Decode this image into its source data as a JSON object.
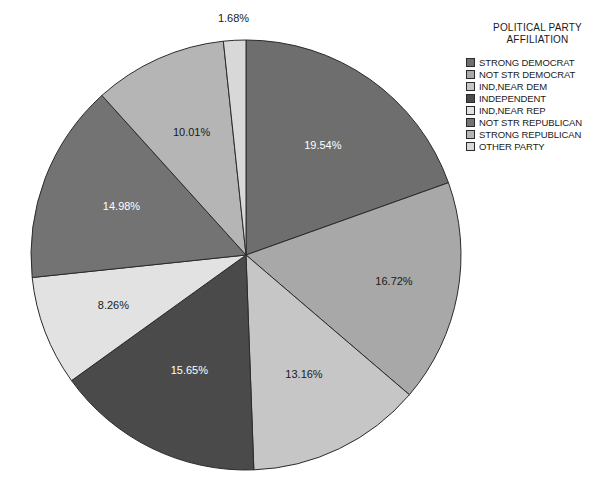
{
  "legend": {
    "title_line1": "POLITICAL PARTY",
    "title_line2": "AFFILIATION",
    "items": [
      {
        "label": "STRONG DEMOCRAT",
        "color": "#6e6e6e"
      },
      {
        "label": "NOT STR DEMOCRAT",
        "color": "#a8a8a8"
      },
      {
        "label": "IND,NEAR DEM",
        "color": "#c6c6c6"
      },
      {
        "label": "INDEPENDENT",
        "color": "#4a4a4a"
      },
      {
        "label": "IND,NEAR REP",
        "color": "#e2e2e2"
      },
      {
        "label": "NOT STR REPUBLICAN",
        "color": "#737373"
      },
      {
        "label": "STRONG REPUBLICAN",
        "color": "#b5b5b5"
      },
      {
        "label": "OTHER PARTY",
        "color": "#d8d8d8"
      }
    ]
  },
  "chart_data": {
    "type": "pie",
    "title": "POLITICAL PARTY AFFILIATION",
    "categories": [
      "STRONG DEMOCRAT",
      "NOT STR DEMOCRAT",
      "IND,NEAR DEM",
      "INDEPENDENT",
      "IND,NEAR REP",
      "NOT STR REPUBLICAN",
      "STRONG REPUBLICAN",
      "OTHER PARTY"
    ],
    "values": [
      19.54,
      16.72,
      13.16,
      15.65,
      8.26,
      14.98,
      10.01,
      1.68
    ],
    "labels": [
      "19.54%",
      "16.72%",
      "13.16%",
      "15.65%",
      "8.26%",
      "14.98%",
      "10.01%",
      "1.68%"
    ],
    "colors": [
      "#6e6e6e",
      "#a8a8a8",
      "#c6c6c6",
      "#4a4a4a",
      "#e2e2e2",
      "#737373",
      "#b5b5b5",
      "#d8d8d8"
    ],
    "label_on_dark": [
      true,
      false,
      false,
      true,
      false,
      true,
      false,
      false
    ],
    "start_angle_deg": 0,
    "direction": "clockwise",
    "legend_position": "right",
    "center": {
      "x": 246,
      "y": 255
    },
    "radius": 215,
    "label_radius_frac": [
      0.62,
      0.7,
      0.62,
      0.6,
      0.66,
      0.62,
      0.62,
      1.1
    ]
  }
}
